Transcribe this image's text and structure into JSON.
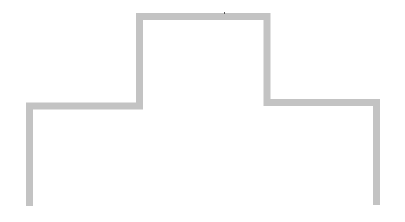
{
  "diagram": {
    "stroke_color": "#c3c3c3",
    "stroke_width": 7,
    "background": "#ffffff",
    "path_points": [
      [
        29.5,
        206
      ],
      [
        29.5,
        106
      ],
      [
        139.5,
        106
      ],
      [
        139.5,
        16.5
      ],
      [
        267,
        16.5
      ],
      [
        267,
        102.5
      ],
      [
        376.5,
        102.5
      ],
      [
        376.5,
        205
      ]
    ],
    "stray_mark": {
      "x": 224,
      "y": 12,
      "color": "#555555"
    }
  }
}
